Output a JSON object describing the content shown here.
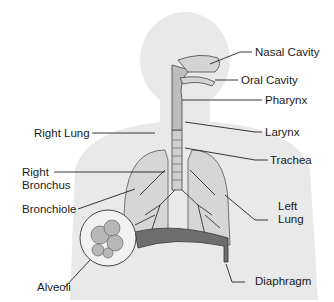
{
  "diagram": {
    "labels": {
      "nasal_cavity": "Nasal Cavity",
      "oral_cavity": "Oral Cavity",
      "pharynx": "Pharynx",
      "larynx": "Larynx",
      "trachea": "Trachea",
      "right_lung": "Right Lung",
      "right_bronchus_1": "Right",
      "right_bronchus_2": "Bronchus",
      "bronchiole": "Bronchiole",
      "left_lung_1": "Left",
      "left_lung_2": "Lung",
      "alveoli": "Alveoli",
      "diaphragm": "Diaphragm"
    },
    "colors": {
      "silhouette": "#e9e9e9",
      "lung": "#d8d8d8",
      "airway": "#c4c4c4",
      "diaphragm": "#6e6e6e",
      "line": "#222222"
    }
  }
}
